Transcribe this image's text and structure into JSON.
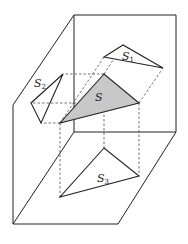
{
  "diagram": {
    "type": "orthographic-projection",
    "colors": {
      "line": "#222222",
      "fill_S": "#c8c8c8",
      "background": "#ffffff"
    },
    "labels": {
      "S": {
        "main": "S",
        "sub": ""
      },
      "S1": {
        "main": "S",
        "sub": "1"
      },
      "S2": {
        "main": "S",
        "sub": "2"
      },
      "S3": {
        "main": "S",
        "sub": "3"
      }
    },
    "planes": [
      "back-plane",
      "left-plane",
      "floor-plane"
    ],
    "triangles": [
      {
        "name": "S",
        "shaded": true
      },
      {
        "name": "S1",
        "projection": "back-plane"
      },
      {
        "name": "S2",
        "projection": "left-plane"
      },
      {
        "name": "S3",
        "projection": "floor-plane"
      }
    ]
  }
}
